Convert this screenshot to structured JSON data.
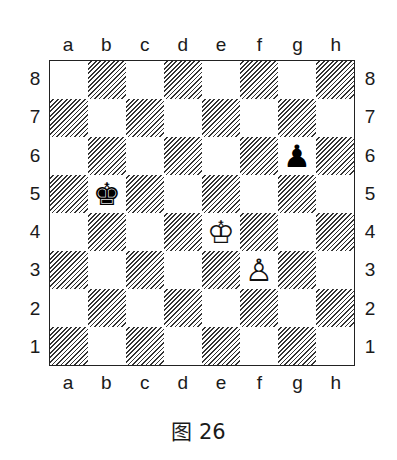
{
  "diagram": {
    "caption": "图 26",
    "files": [
      "a",
      "b",
      "c",
      "d",
      "e",
      "f",
      "g",
      "h"
    ],
    "ranks": [
      "8",
      "7",
      "6",
      "5",
      "4",
      "3",
      "2",
      "1"
    ],
    "square_style": {
      "light": "#ffffff",
      "dark": "diagonal-hatch"
    },
    "pieces": [
      {
        "square": "b5",
        "color": "black",
        "type": "king",
        "glyph": "♚"
      },
      {
        "square": "g6",
        "color": "black",
        "type": "pawn",
        "glyph": "♟"
      },
      {
        "square": "e4",
        "color": "white",
        "type": "king",
        "glyph": "♔"
      },
      {
        "square": "f3",
        "color": "white",
        "type": "pawn",
        "glyph": "♙"
      }
    ]
  }
}
